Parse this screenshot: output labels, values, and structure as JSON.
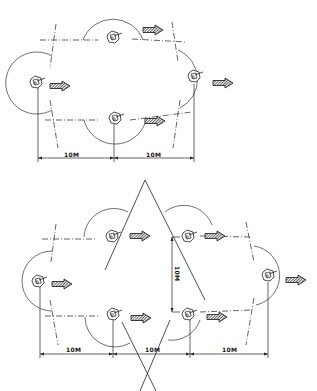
{
  "caption_fragment": "",
  "diagrams": [
    {
      "name": "formation-four-guards",
      "dimension_labels": [
        "10M",
        "10M"
      ],
      "guards": [
        {
          "position": "left",
          "x": 38,
          "y": 82
        },
        {
          "position": "top-center",
          "x": 115,
          "y": 37
        },
        {
          "position": "bottom-center",
          "x": 115,
          "y": 118
        },
        {
          "position": "right",
          "x": 194,
          "y": 78
        }
      ],
      "direction": "right"
    },
    {
      "name": "formation-six-guards",
      "dimension_labels": [
        "10M",
        "10M",
        "10M"
      ],
      "vertical_dimension_label": "10M",
      "guards": [
        {
          "position": "left",
          "x": 38,
          "y": 281
        },
        {
          "position": "top-left",
          "x": 113,
          "y": 236
        },
        {
          "position": "bottom-left",
          "x": 113,
          "y": 316
        },
        {
          "position": "top-right",
          "x": 188,
          "y": 236
        },
        {
          "position": "bottom-right",
          "x": 188,
          "y": 316
        },
        {
          "position": "right",
          "x": 268,
          "y": 278
        }
      ],
      "direction": "right"
    }
  ],
  "labels": {
    "d1_a": "10M",
    "d1_b": "10M",
    "d2_a": "10M",
    "d2_b": "10M",
    "d2_c": "10M",
    "d2_v": "10M"
  }
}
